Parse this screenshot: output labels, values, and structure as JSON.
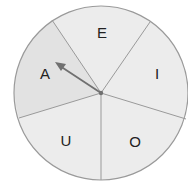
{
  "spinner": {
    "center": {
      "x": 101,
      "y": 93
    },
    "radius": 87,
    "colors": {
      "outline": "#9a9a9a",
      "divider": "#9a9a9a",
      "segment_fill": "#ececec",
      "selected_fill": "#e2e2e2",
      "arrow": "#707070",
      "label": "#222222"
    },
    "segments": [
      {
        "label": "E",
        "label_x": 102,
        "label_y": 38
      },
      {
        "label": "I",
        "label_x": 157,
        "label_y": 79
      },
      {
        "label": "O",
        "label_x": 135,
        "label_y": 147
      },
      {
        "label": "U",
        "label_x": 66,
        "label_y": 146
      },
      {
        "label": "A",
        "label_x": 45,
        "label_y": 79
      }
    ],
    "dividers": [
      {
        "x": 52,
        "y": 20
      },
      {
        "x": 150,
        "y": 22
      },
      {
        "x": 186,
        "y": 119
      },
      {
        "x": 101,
        "y": 180
      },
      {
        "x": 19,
        "y": 118
      }
    ],
    "arrow": {
      "points_to": "A",
      "tip_x": 56,
      "tip_y": 63
    }
  }
}
